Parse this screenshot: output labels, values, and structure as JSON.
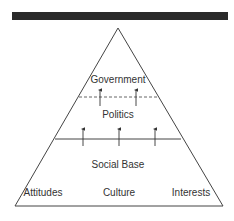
{
  "diagram": {
    "levels": [
      {
        "label": "Government"
      },
      {
        "label": "Politics"
      },
      {
        "label": "Social Base"
      }
    ],
    "base_components": [
      "Attitudes",
      "Culture",
      "Interests"
    ],
    "colors": {
      "line": "#333333",
      "bar": "#2a2a2a"
    }
  }
}
